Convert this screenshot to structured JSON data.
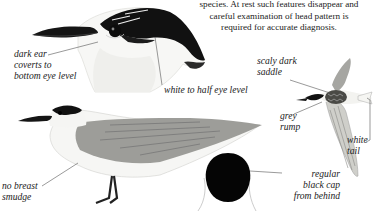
{
  "intro_text": {
    "lines": [
      "species. At rest such features disappear and",
      "careful examination of head pattern is",
      "required for accurate diagnosis."
    ]
  },
  "illustrations": {
    "head_closeup": {
      "labels": {
        "ear_coverts": [
          "dark ear",
          "coverts to",
          "bottom eye level"
        ],
        "white_level": "white to half eye level"
      }
    },
    "standing_bird": {
      "labels": {
        "breast": [
          "no breast",
          "smudge"
        ]
      }
    },
    "flying_bird": {
      "labels": {
        "saddle": [
          "scaly dark",
          "saddle"
        ],
        "rump": [
          "grey",
          "rump"
        ],
        "tail": [
          "white",
          "tail"
        ]
      }
    },
    "cap_from_behind": {
      "labels": {
        "cap": [
          "regular",
          "black cap",
          "from behind"
        ]
      }
    }
  },
  "colors": {
    "ink": "#1a1a1a",
    "cap_black": "#0a0a0a",
    "wing_grey": "#9a9a96",
    "leader_line": "#555555"
  }
}
